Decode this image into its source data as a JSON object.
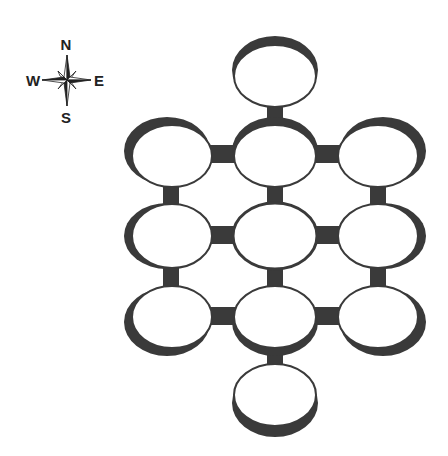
{
  "compass": {
    "north": "N",
    "south": "S",
    "east": "E",
    "west": "W",
    "center": [
      67,
      80
    ]
  },
  "colors": {
    "background": "#ffffff",
    "wall": "#3a3a3a",
    "room": "#ffffff"
  },
  "rooms": [
    {
      "id": "top",
      "cx": 275,
      "cy": 76,
      "shadow": "top"
    },
    {
      "id": "row1-left",
      "cx": 172,
      "cy": 156,
      "shadow": "top-left"
    },
    {
      "id": "row1-center",
      "cx": 275,
      "cy": 156,
      "shadow": "top"
    },
    {
      "id": "row1-right",
      "cx": 378,
      "cy": 156,
      "shadow": "top-right"
    },
    {
      "id": "row2-left",
      "cx": 172,
      "cy": 236,
      "shadow": "left"
    },
    {
      "id": "row2-center",
      "cx": 275,
      "cy": 236,
      "shadow": "none"
    },
    {
      "id": "row2-right",
      "cx": 378,
      "cy": 236,
      "shadow": "right"
    },
    {
      "id": "row3-left",
      "cx": 172,
      "cy": 317,
      "shadow": "bottom-left"
    },
    {
      "id": "row3-center",
      "cx": 275,
      "cy": 317,
      "shadow": "bottom"
    },
    {
      "id": "row3-right",
      "cx": 378,
      "cy": 317,
      "shadow": "bottom-right"
    },
    {
      "id": "bottom",
      "cx": 275,
      "cy": 396,
      "shadow": "bottom"
    }
  ]
}
